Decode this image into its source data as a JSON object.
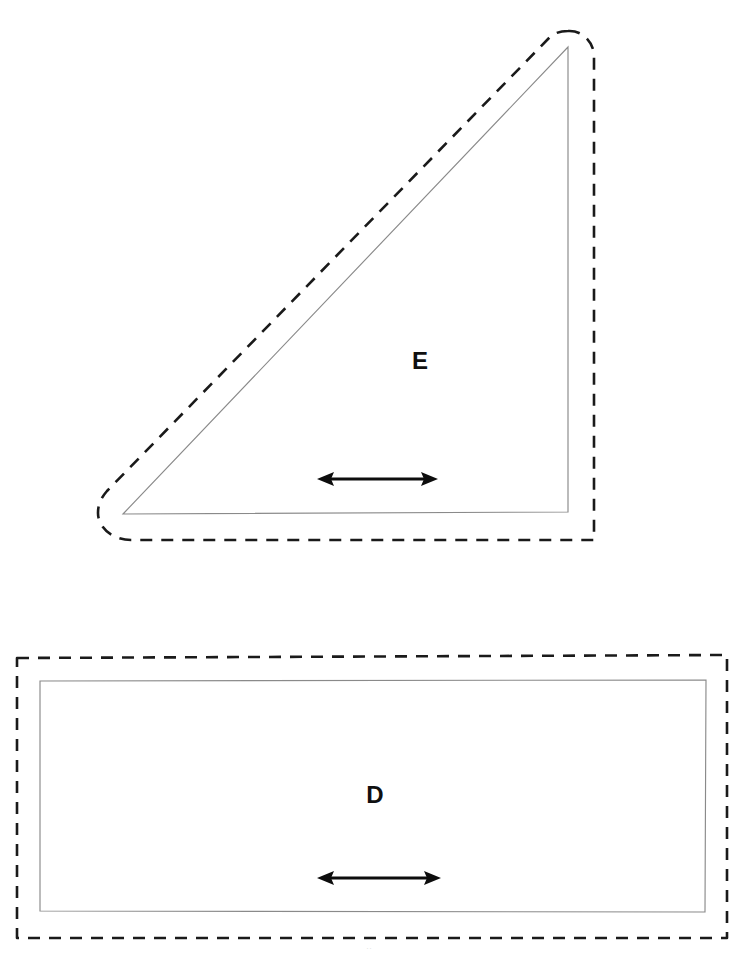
{
  "document": {
    "kind": "sewing-pattern-sheet",
    "background_color": "#ffffff",
    "width": 738,
    "height": 954,
    "bottom_artifact_text": "··"
  },
  "style": {
    "cut_line_color": "#1a1a1a",
    "seam_line_color": "#8a8a8a",
    "grain_arrow_color": "#0d0d0d",
    "label_color": "#101010",
    "cut_line_dash": "12 9"
  },
  "pieces": [
    {
      "id": "piece-e",
      "label": "E",
      "shape": "right-triangle",
      "label_x": 420,
      "label_y": 369,
      "label_size": 24,
      "seam_path": "M 123 514 L 568 47 L 568 512 Z",
      "cut_path": "M 568 31 C 582 30 594 42 594 56 L 594 540 L 131 540 C 112 540 98 527 98 513 C 98 504 101 498 107 491 L 549 38 C 554 33 560 31 568 31 Z",
      "grain": {
        "x1": 318,
        "x2": 437,
        "y": 479,
        "label": "grain-line-arrow"
      }
    },
    {
      "id": "piece-d",
      "label": "D",
      "shape": "rectangle",
      "label_x": 375,
      "label_y": 803,
      "label_size": 24,
      "seam_path": "M 40 681 L 706 680 L 705 912 L 40 911 Z",
      "cut_path": "M 17 658 L 727 655 L 727 938 L 17 938 Z",
      "grain": {
        "x1": 318,
        "x2": 440,
        "y": 878,
        "label": "grain-line-arrow"
      }
    }
  ]
}
